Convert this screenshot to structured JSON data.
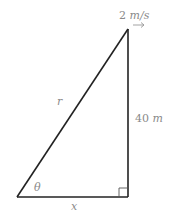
{
  "diagram": {
    "type": "right-triangle",
    "labels": {
      "velocity_value": "2",
      "velocity_unit": "m/s",
      "height_value": "40",
      "height_unit": "m",
      "hypotenuse": "r",
      "base": "x",
      "angle": "θ"
    },
    "velocity_arrow": "right-arrow-icon",
    "right_angle_marker": true,
    "colors": {
      "lines": "#222222",
      "labels": "#8a8a8a"
    }
  }
}
